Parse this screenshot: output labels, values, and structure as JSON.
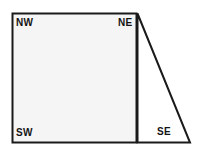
{
  "figure": {
    "name": "quadrant-diagram",
    "background_color": "#ffffff",
    "stroke_color": "#1a1a1a",
    "square_fill": "#f5f5f5",
    "triangle_fill": "#ffffff",
    "labels": {
      "nw": "NW",
      "ne": "NE",
      "sw": "SW",
      "se": "SE"
    },
    "shapes": {
      "square": {
        "name": "square-region",
        "x": 12,
        "y": 13,
        "width": 125,
        "height": 130
      },
      "triangle": {
        "name": "triangle-region",
        "apex_x": 137,
        "apex_y": 13,
        "base_right_x": 190,
        "base_y": 143,
        "base_left_x": 137
      }
    }
  }
}
